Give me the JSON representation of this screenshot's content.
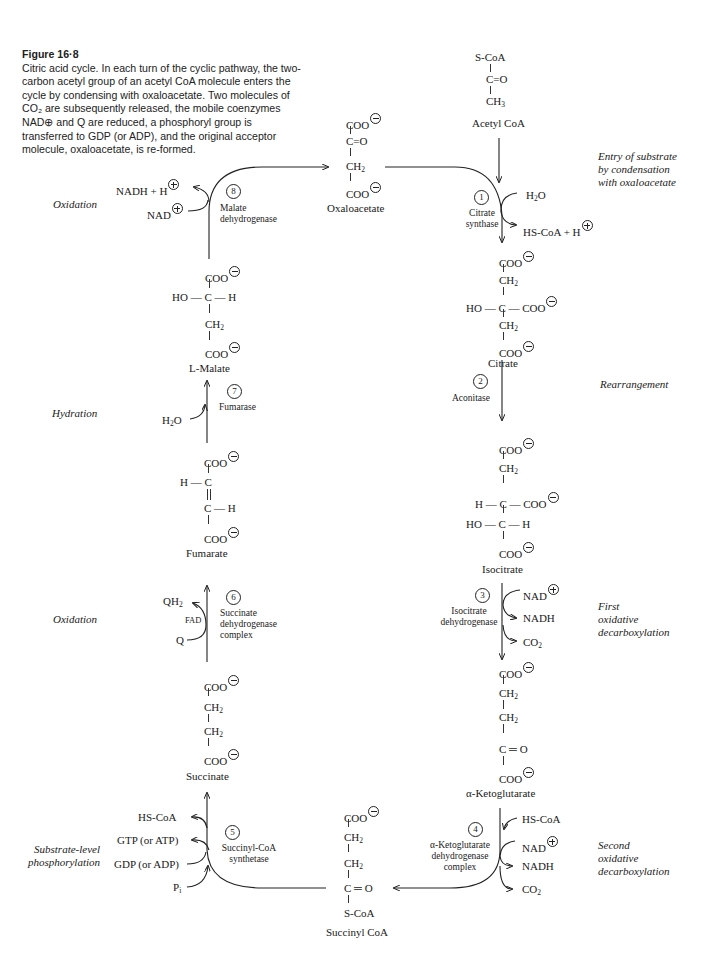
{
  "caption": {
    "title": "Figure 16·8",
    "text": "Citric acid cycle. In each turn of the cyclic pathway, the two-carbon acetyl group of an acetyl CoA molecule enters the cycle by condensing with oxaloacetate. Two molecules of CO₂ are subsequently released, the mobile coenzymes NAD⊕ and Q are reduced, a phosphoryl group is transferred to GDP (or ADP), and the original acceptor molecule, oxaloacetate, is re-formed."
  },
  "molecules": {
    "acetyl_coa": {
      "name": "Acetyl CoA",
      "rows": [
        "S-CoA",
        "C=O",
        "CH3"
      ]
    },
    "oxaloacetate": {
      "name": "Oxaloacetate",
      "rows": [
        "COO⊖",
        "C=O",
        "CH2",
        "COO⊖"
      ]
    },
    "citrate": {
      "name": "Citrate",
      "rows": [
        "COO⊖",
        "CH2",
        "HO—C—COO⊖",
        "CH2",
        "COO⊖"
      ]
    },
    "isocitrate": {
      "name": "Isocitrate",
      "rows": [
        "COO⊖",
        "CH2",
        "H—C—COO⊖",
        "HO—C—H",
        "COO⊖"
      ]
    },
    "alpha_ketoglutarate": {
      "name": "α-Ketoglutarate",
      "rows": [
        "COO⊖",
        "CH2",
        "CH2",
        "C=O",
        "COO⊖"
      ]
    },
    "succinyl_coa": {
      "name": "Succinyl CoA",
      "rows": [
        "COO⊖",
        "CH2",
        "CH2",
        "C=O",
        "S-CoA"
      ]
    },
    "succinate": {
      "name": "Succinate",
      "rows": [
        "COO⊖",
        "CH2",
        "CH2",
        "COO⊖"
      ]
    },
    "fumarate": {
      "name": "Fumarate",
      "rows": [
        "COO⊖",
        "H—C",
        "C—H",
        "COO⊖"
      ]
    },
    "l_malate": {
      "name": "L-Malate",
      "rows": [
        "COO⊖",
        "HO—C—H",
        "CH2",
        "COO⊖"
      ]
    }
  },
  "steps": [
    {
      "number": "1",
      "enzyme": [
        "Citrate",
        "synthase"
      ],
      "inputs": [
        "H2O"
      ],
      "outputs": [
        "HS-CoA + H⊕"
      ],
      "process": [
        "Entry of substrate",
        "by condensation",
        "with oxaloacetate"
      ]
    },
    {
      "number": "2",
      "enzyme": [
        "Aconitase"
      ],
      "inputs": [],
      "outputs": [],
      "process": [
        "Rearrangement"
      ]
    },
    {
      "number": "3",
      "enzyme": [
        "Isocitrate",
        "dehydrogenase"
      ],
      "inputs": [
        "NAD⊕"
      ],
      "outputs": [
        "NADH",
        "CO2"
      ],
      "process": [
        "First",
        "oxidative",
        "decarboxylation"
      ]
    },
    {
      "number": "4",
      "enzyme": [
        "α-Ketoglutarate",
        "dehydrogenase",
        "complex"
      ],
      "inputs": [
        "HS-CoA",
        "NAD⊕"
      ],
      "outputs": [
        "NADH",
        "CO2"
      ],
      "process": [
        "Second",
        "oxidative",
        "decarboxylation"
      ]
    },
    {
      "number": "5",
      "enzyme": [
        "Succinyl-CoA",
        "synthetase"
      ],
      "inputs": [
        "GDP (or ADP)",
        "Pi"
      ],
      "outputs": [
        "HS-CoA",
        "GTP (or ATP)"
      ],
      "process": [
        "Substrate-level",
        "phosphorylation"
      ]
    },
    {
      "number": "6",
      "enzyme": [
        "Succinate",
        "dehydrogenase",
        "complex"
      ],
      "cofactor": "FAD",
      "inputs": [
        "Q"
      ],
      "outputs": [
        "QH2"
      ],
      "process": [
        "Oxidation"
      ]
    },
    {
      "number": "7",
      "enzyme": [
        "Fumarase"
      ],
      "inputs": [
        "H2O"
      ],
      "outputs": [],
      "process": [
        "Hydration"
      ]
    },
    {
      "number": "8",
      "enzyme": [
        "Malate",
        "dehydrogenase"
      ],
      "inputs": [
        "NAD⊕"
      ],
      "outputs": [
        "NADH + H⊕"
      ],
      "process": [
        "Oxidation"
      ]
    }
  ],
  "labels": {
    "s1_in": "H",
    "s1_out": "HS-CoA + H",
    "s3_in": "NAD",
    "s3_out1": "NADH",
    "s3_out2": "CO",
    "s4_in1": "HS-CoA",
    "s4_in2": "NAD",
    "s4_out1": "NADH",
    "s4_out2": "CO",
    "s5_out1": "HS-CoA",
    "s5_out2": "GTP (or ATP)",
    "s5_in1": "GDP (or ADP)",
    "s5_in2": "P",
    "s6_out": "QH",
    "s6_in": "Q",
    "s6_cof": "FAD",
    "s7_in": "H",
    "s8_out": "NADH + H",
    "s8_in": "NAD",
    "h2o_o": "O",
    "two": "2",
    "i": "i"
  }
}
